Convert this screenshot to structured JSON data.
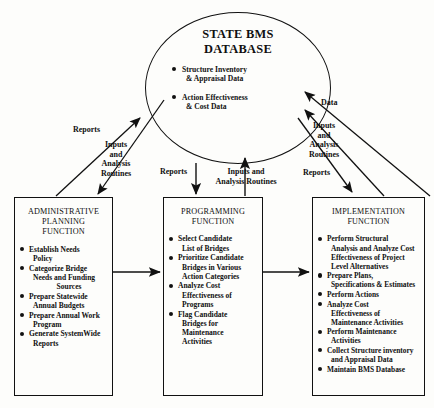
{
  "diagram": {
    "database": {
      "name": "state-bms-database",
      "title_line1": "STATE BMS",
      "title_line2": "DATABASE",
      "bullets": [
        {
          "line1": "Structure Inventory",
          "line2": "& Appraisal Data"
        },
        {
          "line1": "Action Effectiveness",
          "line2": "& Cost Data"
        }
      ]
    },
    "boxes": [
      {
        "id": "administrative-planning-function",
        "title_lines": [
          "ADMINISTRATIVE",
          "PLANNING",
          "FUNCTION"
        ],
        "items": [
          {
            "lines": [
              "Establish Needs",
              "Policy"
            ],
            "center": []
          },
          {
            "lines": [
              "Categorize Bridge",
              "Needs and Funding",
              "Sources"
            ],
            "center": [
              2
            ]
          },
          {
            "lines": [
              "Prepare Statewide",
              "Annual Budgets"
            ],
            "center": []
          },
          {
            "lines": [
              "Prepare Annual Work",
              "Program"
            ],
            "center": []
          },
          {
            "lines": [
              "Generate SystemWide",
              "Reports"
            ],
            "center": []
          }
        ]
      },
      {
        "id": "programming-function",
        "title_lines": [
          "PROGRAMMING",
          "FUNCTION"
        ],
        "items": [
          {
            "lines": [
              "Select Candidate",
              "List of Bridges"
            ],
            "center": []
          },
          {
            "lines": [
              "Prioritize Candidate",
              "Bridges in Various",
              "Action Categories"
            ],
            "center": []
          },
          {
            "lines": [
              "Analyze Cost",
              "Effectiveness of",
              "Programs"
            ],
            "center": []
          },
          {
            "lines": [
              "Flag Candidate",
              "Bridges for",
              "Maintenance",
              "Activities"
            ],
            "center": []
          }
        ]
      },
      {
        "id": "implementation-function",
        "title_lines": [
          "IMPLEMENTATION",
          "FUNCTION"
        ],
        "items": [
          {
            "lines": [
              "Perform Structural",
              "Analysis and Analyze Cost",
              "Effectiveness of Project",
              "Level Alternatives"
            ],
            "center": []
          },
          {
            "lines": [
              "Prepare Plans,",
              "Specifications & Estimates"
            ],
            "center": []
          },
          {
            "lines": [
              "Perform Actions"
            ],
            "center": []
          },
          {
            "lines": [
              "Analyze Cost",
              "Effectiveness of",
              "Maintenance Activities"
            ],
            "center": []
          },
          {
            "lines": [
              "Perform Maintenance",
              "Activities"
            ],
            "center": []
          },
          {
            "lines": [
              "Collect Structure inventory",
              "and Appraisal Data"
            ],
            "center": []
          },
          {
            "lines": [
              "Maintain BMS Database"
            ],
            "center": []
          }
        ]
      }
    ],
    "flow_labels": {
      "left_reports": "Reports",
      "left_inputs_l1": "Inputs",
      "left_inputs_l2": "and",
      "left_inputs_l3": "Analysis",
      "left_inputs_l4": "Routines",
      "center_reports": "Reports",
      "center_inputs_l1": "Inputs and",
      "center_inputs_l2": "Analysis Routines",
      "right_data": "Data",
      "right_inputs_l1": "Inputs",
      "right_inputs_l2": "and",
      "right_inputs_l3": "Analysis",
      "right_inputs_l4": "Routines",
      "right_reports": "Reports"
    },
    "colors": {
      "stroke": "#111111",
      "background": "#fdfdfb",
      "text": "#101010"
    }
  }
}
